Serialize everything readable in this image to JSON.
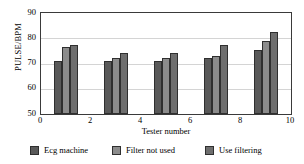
{
  "chart_data": {
    "type": "bar",
    "title": "",
    "subtitle": "",
    "xlabel": "Tester number",
    "ylabel": "PULSE/BPM",
    "xlim": [
      0,
      10
    ],
    "ylim": [
      50,
      90
    ],
    "xticks": [
      0,
      2,
      4,
      6,
      8,
      10
    ],
    "yticks": [
      50,
      60,
      70,
      80,
      90
    ],
    "grid": "horizontal",
    "legend_position": "bottom",
    "x": [
      1,
      3,
      5,
      7,
      9
    ],
    "categories": [
      "1",
      "3",
      "5",
      "7",
      "9"
    ],
    "series": [
      {
        "name": "Ecg machine",
        "color": "#595959",
        "values": [
          71,
          71,
          71,
          72,
          75.5
        ]
      },
      {
        "name": "Filter not used",
        "color": "#8c8c8c",
        "values": [
          76.5,
          72,
          72,
          73,
          79
        ]
      },
      {
        "name": "Use filtering",
        "color": "#6e6e6e",
        "values": [
          77.5,
          74,
          74,
          77.5,
          82.5
        ]
      }
    ]
  },
  "axes": {
    "ylabel": "PULSE/BPM",
    "xlabel": "Tester number",
    "ytick_labels": [
      "90",
      "80",
      "70",
      "60",
      "50"
    ],
    "xtick_labels": [
      "0",
      "2",
      "4",
      "6",
      "8",
      "10"
    ]
  },
  "legend": {
    "items": [
      {
        "label": "Ecg machine",
        "color": "#595959"
      },
      {
        "label": "Filter not used",
        "color": "#8c8c8c"
      },
      {
        "label": "Use filtering",
        "color": "#6e6e6e"
      }
    ]
  },
  "style": {
    "axis_color": "#3a3a3a",
    "grid_color": "#d4d4d4",
    "bar_edge_color": "#2f2f2f",
    "background": "#ffffff"
  }
}
